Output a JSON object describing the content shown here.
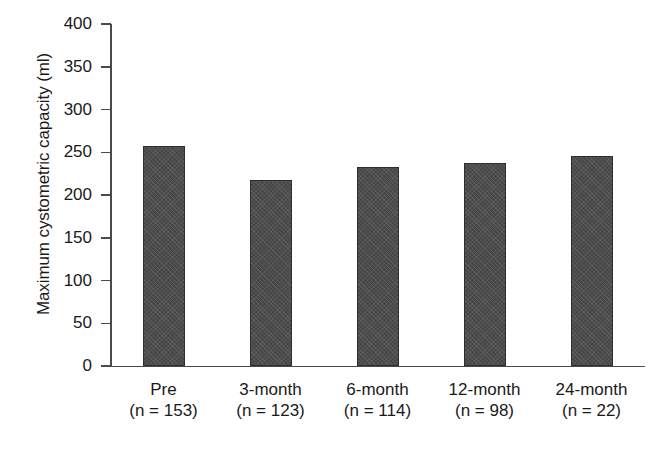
{
  "chart_data": {
    "type": "bar",
    "title": "",
    "xlabel": "",
    "ylabel": "Maximum cystometric capacity (ml)",
    "ylim": [
      0,
      400
    ],
    "ytick_step": 50,
    "yticks": [
      "400",
      "350",
      "300",
      "250",
      "200",
      "150",
      "100",
      "50",
      "0"
    ],
    "grid": false,
    "legend": null,
    "bar_color": "#4e4e4e",
    "bar_edge_color": "#2e2e2e",
    "axis_color": "#4a4a4a",
    "categories": [
      "Pre",
      "3-month",
      "6-month",
      "12-month",
      "24-month"
    ],
    "category_counts": [
      "(n = 153)",
      "(n = 123)",
      "(n = 114)",
      "(n = 98)",
      "(n = 22)"
    ],
    "values": [
      257,
      218,
      233,
      238,
      246
    ]
  }
}
